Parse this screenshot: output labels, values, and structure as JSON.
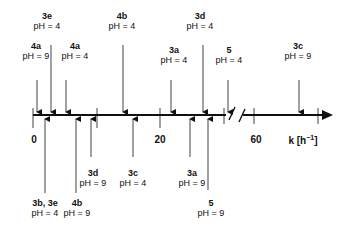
{
  "axis": {
    "tick_labels": [
      "0",
      "20",
      "60"
    ],
    "unit_label": "k [h",
    "unit_exp": "−1",
    "unit_close": "]"
  },
  "top_markers": [
    {
      "id": "4a",
      "ph": "pH = 9"
    },
    {
      "id": "3e",
      "ph": "pH = 4"
    },
    {
      "id": "4a",
      "ph": "pH = 4"
    },
    {
      "id": "4b",
      "ph": "pH = 4"
    },
    {
      "id": "3a",
      "ph": "pH = 4"
    },
    {
      "id": "3d",
      "ph": "pH = 4"
    },
    {
      "id": "5",
      "ph": "pH = 4"
    },
    {
      "id": "3c",
      "ph": "pH = 9"
    }
  ],
  "bottom_markers": [
    {
      "id": "3b, 3e",
      "ph": "pH = 4"
    },
    {
      "id": "4b",
      "ph": "pH = 9"
    },
    {
      "id": "3d",
      "ph": "pH = 9"
    },
    {
      "id": "3c",
      "ph": "pH = 4"
    },
    {
      "id": "3a",
      "ph": "pH = 9"
    },
    {
      "id": "5",
      "ph": "pH = 9"
    }
  ]
}
